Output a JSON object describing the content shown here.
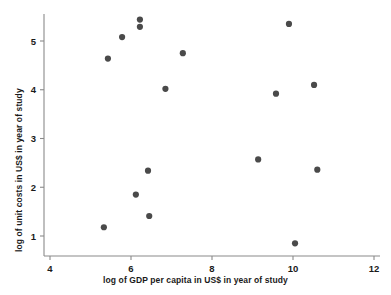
{
  "chart_data": {
    "type": "scatter",
    "title": "",
    "xlabel": "log of GDP per capita in US$ in year of study",
    "ylabel": "log of unit costs in US$ in year of study",
    "xlim": [
      4,
      12
    ],
    "ylim": [
      0.55,
      5.65
    ],
    "xticks": [
      4,
      6,
      8,
      10,
      12
    ],
    "yticks": [
      1,
      2,
      3,
      4,
      5
    ],
    "xtick_labels": [
      "4",
      "6",
      "8",
      "10",
      "12"
    ],
    "ytick_labels": [
      "1",
      "2",
      "3",
      "4",
      "5"
    ],
    "grid": false,
    "legend": null,
    "marker_color": "#4a4a4a",
    "axis_color": "#8a8a8a",
    "points": [
      {
        "x": 5.33,
        "y": 1.18
      },
      {
        "x": 5.43,
        "y": 4.64
      },
      {
        "x": 5.78,
        "y": 5.08
      },
      {
        "x": 6.12,
        "y": 1.85
      },
      {
        "x": 6.22,
        "y": 5.44
      },
      {
        "x": 6.22,
        "y": 5.29
      },
      {
        "x": 6.42,
        "y": 2.34
      },
      {
        "x": 6.45,
        "y": 1.41
      },
      {
        "x": 6.85,
        "y": 4.02
      },
      {
        "x": 7.28,
        "y": 4.75
      },
      {
        "x": 9.14,
        "y": 2.57
      },
      {
        "x": 9.58,
        "y": 3.92
      },
      {
        "x": 9.9,
        "y": 5.35
      },
      {
        "x": 10.05,
        "y": 0.85
      },
      {
        "x": 10.52,
        "y": 4.1
      },
      {
        "x": 10.6,
        "y": 2.36
      }
    ]
  }
}
